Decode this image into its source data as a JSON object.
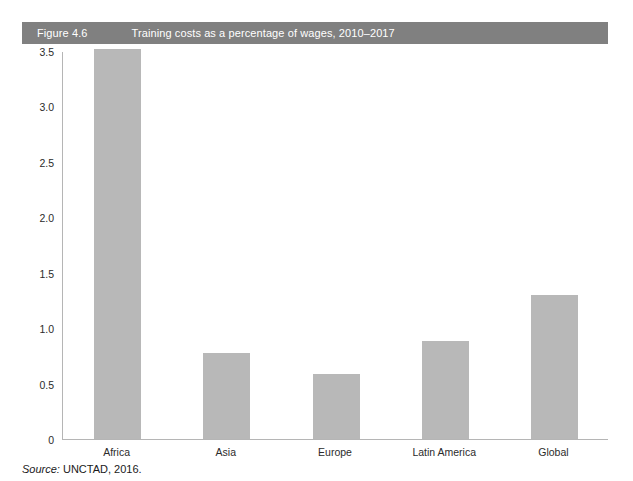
{
  "figure": {
    "number": "Figure 4.6",
    "title": "Training costs as a percentage of wages,  2010–2017",
    "bar_color": "#808080",
    "text_color": "#ffffff"
  },
  "source": {
    "label": "Source:",
    "text": " UNCTAD, 2016."
  },
  "chart_data": {
    "type": "bar",
    "title": "Training costs as a percentage of wages,  2010–2017",
    "xlabel": "",
    "ylabel": "",
    "categories": [
      "Africa",
      "Asia",
      "Europe",
      "Latin America",
      "Global"
    ],
    "values": [
      3.52,
      0.78,
      0.59,
      0.88,
      1.3
    ],
    "ylim": [
      0,
      3.5
    ],
    "yticks": [
      0,
      0.5,
      1.0,
      1.5,
      2.0,
      2.5,
      3.0,
      3.5
    ],
    "ytick_labels": [
      "0",
      "0.5",
      "1.0",
      "1.5",
      "2.0",
      "2.5",
      "3.0",
      "3.5"
    ],
    "grid": false,
    "legend": false,
    "series_color": "#b8b8b8"
  }
}
